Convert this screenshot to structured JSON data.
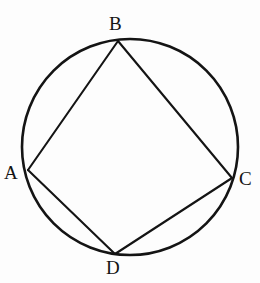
{
  "figure": {
    "background_color": "#fdfdfd",
    "stroke_color": "#141414",
    "circle": {
      "center_x": 130,
      "center_y": 147,
      "radius": 108,
      "stroke_width": 2.6
    },
    "vertices": [
      {
        "name": "A",
        "label": "A",
        "x": 28,
        "y": 170
      },
      {
        "name": "B",
        "label": "B",
        "x": 118,
        "y": 41
      },
      {
        "name": "C",
        "label": "C",
        "x": 232,
        "y": 178
      },
      {
        "name": "D",
        "label": "D",
        "x": 115,
        "y": 254
      }
    ],
    "chords": [
      {
        "name": "AB",
        "from": "A",
        "to": "B",
        "x1": 28,
        "y1": 170,
        "x2": 118,
        "y2": 41
      },
      {
        "name": "BC",
        "from": "B",
        "to": "C",
        "x1": 118,
        "y1": 41,
        "x2": 232,
        "y2": 178
      },
      {
        "name": "CD",
        "from": "C",
        "to": "D",
        "x1": 232,
        "y1": 178,
        "x2": 115,
        "y2": 254
      },
      {
        "name": "DA",
        "from": "D",
        "to": "A",
        "x1": 115,
        "y1": 254,
        "x2": 28,
        "y2": 170
      }
    ],
    "chord_stroke_width": 2.1,
    "labels": {
      "A": "A",
      "B": "B",
      "C": "C",
      "D": "D"
    }
  }
}
